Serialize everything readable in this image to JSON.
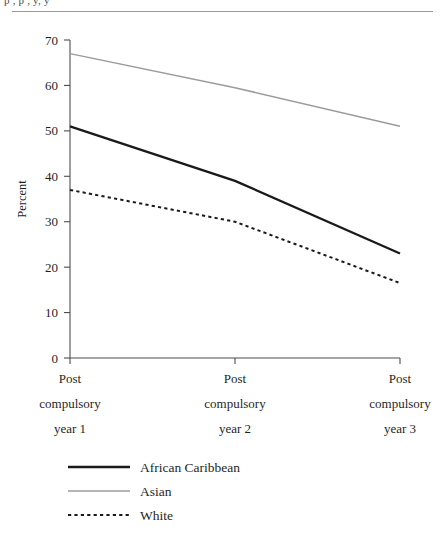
{
  "page": {
    "top_text_remnant": "p   ,   p   ,   y, y"
  },
  "chart_data": {
    "type": "line",
    "title": "",
    "xlabel": "",
    "ylabel": "Percent",
    "ylim": [
      0,
      70
    ],
    "yticks": [
      0,
      10,
      20,
      30,
      40,
      50,
      60,
      70
    ],
    "ytick_labels": [
      "0",
      "10",
      "20",
      "30",
      "40",
      "50",
      "60",
      "70"
    ],
    "grid": false,
    "legend_position": "bottom-left",
    "categories": [
      "Post compulsory year 1",
      "Post compulsory year 2",
      "Post compulsory year 3"
    ],
    "category_lines": [
      [
        "Post",
        "compulsory",
        "year 1"
      ],
      [
        "Post",
        "compulsory",
        "year 2"
      ],
      [
        "Post",
        "compulsory",
        "year 3"
      ]
    ],
    "series": [
      {
        "name": "African Caribbean",
        "values": [
          51,
          39,
          23
        ],
        "color": "#1a1a1a",
        "style": "solid",
        "width": 2.3
      },
      {
        "name": "Asian",
        "values": [
          67,
          59.5,
          51
        ],
        "color": "#9b9b9b",
        "style": "solid",
        "width": 1.5
      },
      {
        "name": "White",
        "values": [
          37,
          30,
          16.5
        ],
        "color": "#1a1a1a",
        "style": "dotted",
        "width": 2.0
      }
    ]
  },
  "legend": {
    "items": [
      {
        "label": "African Caribbean",
        "swatch": "solid-black-line"
      },
      {
        "label": "Asian",
        "swatch": "solid-gray-line"
      },
      {
        "label": "White",
        "swatch": "dotted-black-line"
      }
    ]
  }
}
